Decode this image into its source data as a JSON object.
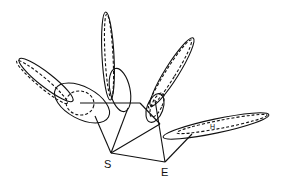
{
  "diagram": {
    "labels": {
      "s": "S",
      "e": "E",
      "h": "H"
    },
    "colors": {
      "stroke": "#111111",
      "background": "#ffffff"
    },
    "nodes": [
      {
        "id": "S",
        "x": 111,
        "y": 153
      },
      {
        "id": "E",
        "x": 165,
        "y": 162
      }
    ],
    "ellipse_groups": [
      {
        "name": "left",
        "solid": 2,
        "dashed": 2
      },
      {
        "name": "top-center",
        "solid": 2,
        "dashed": 1
      },
      {
        "name": "upper-right",
        "solid": 2,
        "dashed": 2
      },
      {
        "name": "right",
        "solid": 1,
        "dashed": 1,
        "label": "H"
      }
    ]
  }
}
